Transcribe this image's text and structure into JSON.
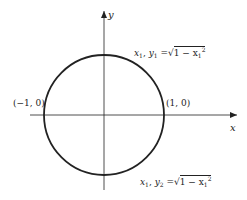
{
  "diagram": {
    "title": "",
    "axes": {
      "x_label": "x",
      "y_label": "y"
    },
    "circle": {
      "center": [
        0,
        0
      ],
      "radius": 1,
      "description": "unit circle"
    },
    "points": [
      {
        "label": "(−1, 0)"
      },
      {
        "label": "(1, 0)"
      }
    ],
    "annotations": {
      "upper": {
        "var1": "x",
        "sub1": "1",
        "var2": "y",
        "sub2": "1",
        "eq": "=",
        "radicand_pre": "1 − x",
        "radicand_sub": "1",
        "radicand_sup": "2"
      },
      "lower": {
        "var1": "x",
        "sub1": "1",
        "var2": "y",
        "sub2": "2",
        "eq": "=",
        "radicand_pre": "1 − x",
        "radicand_sub": "1",
        "radicand_sup": "2"
      }
    }
  },
  "colors": {
    "stroke": "#222222",
    "background": "#ffffff"
  }
}
